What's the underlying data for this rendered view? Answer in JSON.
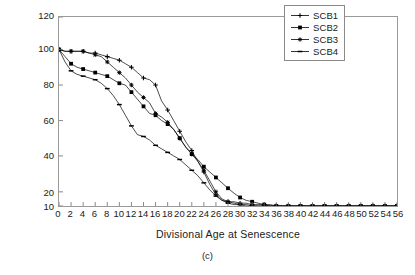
{
  "figure": {
    "caption": "(c)"
  },
  "chart_data": {
    "type": "line",
    "title": "",
    "xlabel": "Divisional Age at Senescence",
    "ylabel": "Viability (%)",
    "xlim": [
      0,
      56
    ],
    "ylim": [
      10,
      120
    ],
    "grid": false,
    "legend_position": "top-right",
    "xticks": [
      0,
      2,
      4,
      6,
      8,
      10,
      12,
      14,
      16,
      18,
      20,
      22,
      24,
      26,
      28,
      30,
      32,
      34,
      36,
      38,
      40,
      42,
      44,
      46,
      48,
      50,
      52,
      54,
      56
    ],
    "yticks": [
      10,
      20,
      40,
      60,
      80,
      100,
      120
    ],
    "x": [
      0,
      1,
      2,
      3,
      4,
      5,
      6,
      7,
      8,
      9,
      10,
      11,
      12,
      13,
      14,
      15,
      16,
      17,
      18,
      19,
      20,
      21,
      22,
      23,
      24,
      25,
      26,
      27,
      28,
      29,
      30,
      31,
      32,
      33,
      34,
      35,
      36,
      37,
      38,
      39,
      40,
      41,
      42,
      43,
      44,
      45,
      46,
      47,
      48,
      49,
      50,
      51,
      52,
      53,
      54,
      55,
      56
    ],
    "series": [
      {
        "name": "SCB1",
        "marker": "plus",
        "color": "#000000",
        "values": [
          100,
          99,
          99,
          99,
          99,
          98,
          98,
          97,
          96,
          95,
          94,
          92,
          90,
          87,
          84,
          83,
          80,
          71,
          66,
          60,
          54,
          48,
          43,
          37,
          31,
          24,
          18,
          14,
          13,
          13,
          12,
          12,
          11,
          11,
          11,
          10,
          10,
          10,
          10,
          10,
          10,
          10,
          10,
          10,
          10,
          10,
          10,
          10,
          10,
          10,
          10,
          10,
          10,
          10,
          10,
          10,
          10
        ]
      },
      {
        "name": "SCB2",
        "marker": "square",
        "color": "#000000",
        "values": [
          100,
          96,
          92,
          90,
          89,
          88,
          87,
          86,
          85,
          83,
          81,
          80,
          76,
          72,
          68,
          64,
          63,
          60,
          58,
          55,
          50,
          45,
          41,
          38,
          34,
          31,
          28,
          25,
          22,
          19,
          16,
          14,
          13,
          12,
          11,
          11,
          10,
          10,
          10,
          10,
          10,
          10,
          10,
          10,
          10,
          10,
          10,
          10,
          10,
          10,
          10,
          10,
          10,
          10,
          10,
          10,
          10
        ]
      },
      {
        "name": "SCB3",
        "marker": "star",
        "color": "#000000",
        "values": [
          100,
          99,
          99,
          99,
          99,
          98,
          97,
          96,
          93,
          90,
          87,
          84,
          80,
          76,
          73,
          70,
          64,
          62,
          59,
          55,
          50,
          45,
          41,
          37,
          32,
          26,
          20,
          15,
          13,
          12,
          11,
          11,
          10,
          10,
          10,
          10,
          10,
          10,
          10,
          10,
          10,
          10,
          10,
          10,
          10,
          10,
          10,
          10,
          10,
          10,
          10,
          10,
          10,
          10,
          10,
          10,
          10
        ]
      },
      {
        "name": "SCB4",
        "marker": "dash",
        "color": "#000000",
        "values": [
          100,
          93,
          88,
          86,
          85,
          84,
          83,
          81,
          78,
          74,
          69,
          63,
          57,
          52,
          51,
          49,
          46,
          44,
          42,
          40,
          38,
          35,
          32,
          29,
          25,
          21,
          17,
          14,
          12,
          11,
          11,
          10,
          10,
          10,
          10,
          10,
          10,
          10,
          10,
          10,
          10,
          10,
          10,
          10,
          10,
          10,
          10,
          10,
          10,
          10,
          10,
          10,
          10,
          10,
          10,
          10,
          10
        ]
      }
    ]
  },
  "legend": {
    "items": [
      {
        "label": "SCB1"
      },
      {
        "label": "SCB2"
      },
      {
        "label": "SCB3"
      },
      {
        "label": "SCB4"
      }
    ]
  }
}
